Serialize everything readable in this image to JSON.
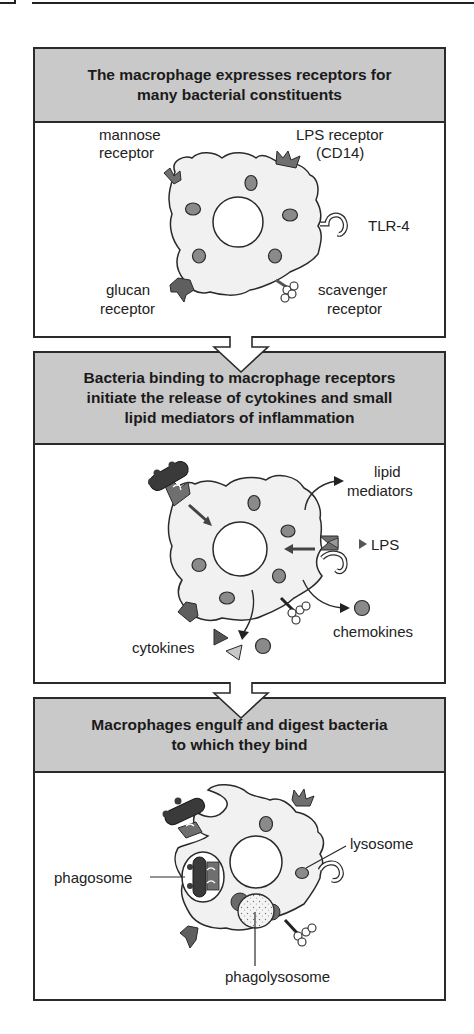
{
  "figure": {
    "panels": [
      {
        "title": "The macrophage expresses receptors for many bacterial constituents",
        "title_lines": [
          "The macrophage expresses receptors for",
          "many bacterial constituents"
        ],
        "labels": {
          "mannose_1": "mannose",
          "mannose_2": "receptor",
          "lps_1": "LPS receptor",
          "lps_2": "(CD14)",
          "tlr4": "TLR-4",
          "glucan_1": "glucan",
          "glucan_2": "receptor",
          "scavenger_1": "scavenger",
          "scavenger_2": "receptor"
        }
      },
      {
        "title": "Bacteria binding to macrophage receptors initiate the release of cytokines and small lipid mediators of inflammation",
        "title_lines": [
          "Bacteria binding to macrophage receptors",
          "initiate the release of cytokines and small",
          "lipid mediators of inflammation"
        ],
        "labels": {
          "lipid_1": "lipid",
          "lipid_2": "mediators",
          "lps": "LPS",
          "chemokines": "chemokines",
          "cytokines": "cytokines"
        }
      },
      {
        "title": "Macrophages engulf and digest bacteria to which they bind",
        "title_lines": [
          "Macrophages engulf and digest bacteria",
          "to which they bind"
        ],
        "labels": {
          "lysosome": "lysosome",
          "phagosome": "phagosome",
          "phagolysosome": "phagolysosome"
        }
      }
    ],
    "colors": {
      "header_gray": "#c9c9c9",
      "cell_fill": "#f1f1f1",
      "organelle": "#8a8a8a",
      "receptor": "#6f6f6f",
      "bacterium": "#3a3a3a",
      "outline": "#2a2a2a"
    }
  }
}
